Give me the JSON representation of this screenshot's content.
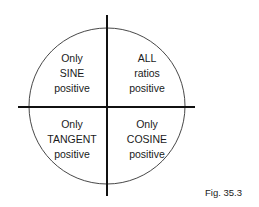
{
  "diagram": {
    "quadrants": {
      "top_left": {
        "lines": [
          "Only",
          "SINE",
          "positive"
        ]
      },
      "top_right": {
        "lines": [
          "ALL",
          "ratios",
          "positive"
        ]
      },
      "bottom_left": {
        "lines": [
          "Only",
          "TANGENT",
          "positive"
        ]
      },
      "bottom_right": {
        "lines": [
          "Only",
          "COSINE",
          "positive"
        ]
      }
    },
    "caption": "Fig. 35.3"
  }
}
